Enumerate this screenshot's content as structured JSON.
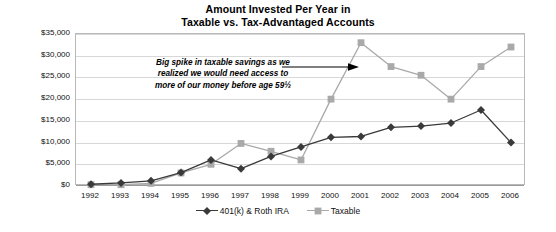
{
  "chart_data": {
    "type": "line",
    "title": "Amount Invested Per Year in Taxable vs. Tax-Advantaged Accounts",
    "title_lines": [
      "Amount Invested Per Year in",
      "Taxable vs. Tax-Advantaged Accounts"
    ],
    "xlabel": "",
    "ylabel": "",
    "grid": true,
    "legend_position": "bottom",
    "ylim": [
      0,
      35000
    ],
    "ytick_step": 5000,
    "categories": [
      "1992",
      "1993",
      "1994",
      "1995",
      "1996",
      "1997",
      "1998",
      "1999",
      "2000",
      "2001",
      "2002",
      "2003",
      "2004",
      "2005",
      "2006"
    ],
    "ytick_labels": [
      "$0",
      "$5,000",
      "$10,000",
      "$15,000",
      "$20,000",
      "$25,000",
      "$30,000",
      "$35,000"
    ],
    "ytick_values": [
      0,
      5000,
      10000,
      15000,
      20000,
      25000,
      30000,
      35000
    ],
    "series": [
      {
        "name": "401(k) & Roth IRA",
        "color": "#3a3a3a",
        "marker": "diamond",
        "values": [
          400,
          700,
          1200,
          3100,
          6000,
          4000,
          6800,
          9000,
          11200,
          11400,
          13500,
          13800,
          14500,
          17500,
          10000
        ]
      },
      {
        "name": "Taxable",
        "color": "#a9a9a9",
        "marker": "square",
        "values": [
          300,
          300,
          600,
          3000,
          5000,
          9800,
          8000,
          6000,
          20000,
          33000,
          27500,
          25500,
          20000,
          27500,
          32000
        ]
      }
    ],
    "annotations": [
      {
        "text": "Big spike in taxable savings as we realized we would need access to more of our money before age 59½",
        "lines": [
          "Big spike in taxable savings as we",
          "realized we would need access to",
          "more of our money before age 59½"
        ],
        "arrow": "right-arrow",
        "points_to": "2001"
      }
    ]
  },
  "colors": {
    "series_401k": "#3a3a3a",
    "series_taxable": "#a9a9a9",
    "gridline": "#d8d8d8",
    "frame": "#b9b9b9",
    "text": "#111111"
  }
}
